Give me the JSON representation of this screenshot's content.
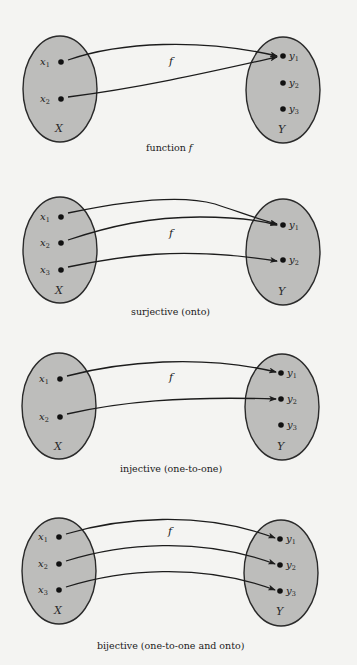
{
  "colors": {
    "background": "#f4f4f2",
    "set_fill": "#bdbdbb",
    "set_stroke": "#2a2a2a",
    "point": "#111111",
    "arrow": "#1c1c1c"
  },
  "diagrams": [
    {
      "id": "function",
      "caption": "function f",
      "caption_prefix": "function",
      "caption_symbol": "f",
      "function_label": "f",
      "domain": {
        "name": "X",
        "ellipse": {
          "cx": 60,
          "cy": 89,
          "rx": 37,
          "ry": 53
        },
        "elements": [
          {
            "name": "x",
            "sub": "1",
            "x": 60,
            "y": 62
          },
          {
            "name": "x",
            "sub": "2",
            "x": 60,
            "y": 99
          }
        ]
      },
      "codomain": {
        "name": "Y",
        "ellipse": {
          "cx": 283,
          "cy": 90,
          "rx": 37,
          "ry": 53
        },
        "elements": [
          {
            "name": "y",
            "sub": "1",
            "x": 283,
            "y": 56
          },
          {
            "name": "y",
            "sub": "2",
            "x": 283,
            "y": 83
          },
          {
            "name": "y",
            "sub": "3",
            "x": 283,
            "y": 109
          }
        ]
      },
      "mappings": [
        {
          "from": "x1",
          "to": "y1"
        },
        {
          "from": "x2",
          "to": "y1"
        }
      ]
    },
    {
      "id": "surjective",
      "caption": "surjective (onto)",
      "function_label": "f",
      "domain": {
        "name": "X",
        "ellipse": {
          "cx": 60,
          "cy": 250,
          "rx": 37,
          "ry": 53
        },
        "elements": [
          {
            "name": "x",
            "sub": "1",
            "x": 60,
            "y": 217
          },
          {
            "name": "x",
            "sub": "2",
            "x": 60,
            "y": 243
          },
          {
            "name": "x",
            "sub": "3",
            "x": 60,
            "y": 270
          }
        ]
      },
      "codomain": {
        "name": "Y",
        "ellipse": {
          "cx": 283,
          "cy": 252,
          "rx": 37,
          "ry": 53
        },
        "elements": [
          {
            "name": "y",
            "sub": "1",
            "x": 283,
            "y": 225
          },
          {
            "name": "y",
            "sub": "2",
            "x": 283,
            "y": 260
          }
        ]
      },
      "mappings": [
        {
          "from": "x1",
          "to": "y1"
        },
        {
          "from": "x2",
          "to": "y1"
        },
        {
          "from": "x3",
          "to": "y2"
        }
      ]
    },
    {
      "id": "injective",
      "caption": "injective (one-to-one)",
      "function_label": "f",
      "domain": {
        "name": "X",
        "ellipse": {
          "cx": 59,
          "cy": 406,
          "rx": 37,
          "ry": 53
        },
        "elements": [
          {
            "name": "x",
            "sub": "1",
            "x": 59,
            "y": 379
          },
          {
            "name": "x",
            "sub": "2",
            "x": 59,
            "y": 417
          }
        ]
      },
      "codomain": {
        "name": "Y",
        "ellipse": {
          "cx": 282,
          "cy": 407,
          "rx": 37,
          "ry": 53
        },
        "elements": [
          {
            "name": "y",
            "sub": "1",
            "x": 281,
            "y": 373
          },
          {
            "name": "y",
            "sub": "2",
            "x": 281,
            "y": 399
          },
          {
            "name": "y",
            "sub": "3",
            "x": 281,
            "y": 425
          }
        ]
      },
      "mappings": [
        {
          "from": "x1",
          "to": "y1"
        },
        {
          "from": "x2",
          "to": "y2"
        }
      ]
    },
    {
      "id": "bijective",
      "caption": "bijective (one-to-one and onto)",
      "function_label": "f",
      "domain": {
        "name": "X",
        "ellipse": {
          "cx": 59,
          "cy": 571,
          "rx": 37,
          "ry": 53
        },
        "elements": [
          {
            "name": "x",
            "sub": "1",
            "x": 58,
            "y": 537
          },
          {
            "name": "x",
            "sub": "2",
            "x": 58,
            "y": 564
          },
          {
            "name": "x",
            "sub": "3",
            "x": 58,
            "y": 590
          }
        ]
      },
      "codomain": {
        "name": "Y",
        "ellipse": {
          "cx": 281,
          "cy": 573,
          "rx": 37,
          "ry": 53
        },
        "elements": [
          {
            "name": "y",
            "sub": "1",
            "x": 280,
            "y": 539
          },
          {
            "name": "y",
            "sub": "2",
            "x": 280,
            "y": 565
          },
          {
            "name": "y",
            "sub": "3",
            "x": 280,
            "y": 591
          }
        ]
      },
      "mappings": [
        {
          "from": "x1",
          "to": "y1"
        },
        {
          "from": "x2",
          "to": "y2"
        },
        {
          "from": "x3",
          "to": "y3"
        }
      ]
    }
  ]
}
